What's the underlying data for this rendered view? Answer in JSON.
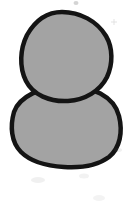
{
  "canvas": {
    "width": 130,
    "height": 206,
    "background_color": "#ffffff",
    "description": "Hand-drawn two-blob figure, snowman-like silhouette"
  },
  "artwork": {
    "title": "Two Stacked Blobs",
    "style": "hand-drawn ink outline with flat gray fill",
    "stroke_color": "#141414",
    "fill_color": "#a3a3a3",
    "stroke_width": 4.5,
    "shapes": [
      {
        "name": "lower-blob",
        "role": "body",
        "fill": "#a3a3a3",
        "stroke": "#141414",
        "center_x": 66,
        "center_y": 126,
        "radius_x": 54,
        "radius_y": 41,
        "bounds": {
          "left": 12,
          "top": 86,
          "right": 120,
          "bottom": 166
        }
      },
      {
        "name": "upper-blob",
        "role": "head",
        "fill": "#a3a3a3",
        "stroke": "#141414",
        "center_x": 66,
        "center_y": 57,
        "radius_x": 46,
        "radius_y": 45,
        "bounds": {
          "left": 20,
          "top": 12,
          "right": 112,
          "bottom": 102
        }
      }
    ],
    "smudges": [
      {
        "name": "smudge-top",
        "x": 76,
        "y": 3,
        "size": 3,
        "opacity": 0.22
      },
      {
        "name": "smudge-upper-right",
        "x": 114,
        "y": 22,
        "size": 4,
        "opacity": 0.18
      },
      {
        "name": "smudge-lower-left",
        "x": 38,
        "y": 180,
        "size": 7,
        "opacity": 0.1
      },
      {
        "name": "smudge-lower-right",
        "x": 84,
        "y": 176,
        "size": 5,
        "opacity": 0.09
      },
      {
        "name": "smudge-bottom-right",
        "x": 99,
        "y": 198,
        "size": 6,
        "opacity": 0.08
      },
      {
        "name": "smudge-mid-right",
        "x": 118,
        "y": 150,
        "size": 4,
        "opacity": 0.1
      }
    ]
  }
}
